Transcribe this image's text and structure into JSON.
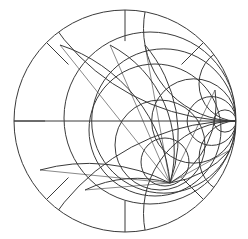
{
  "diagram": {
    "type": "smith-chart-overlay",
    "stroke": "#3a3a3a",
    "outer": {
      "cx": 125,
      "cy": 121,
      "r": 111
    },
    "point_a": {
      "x": 236,
      "y": 121
    },
    "point_b": {
      "x": 170,
      "y": 183
    },
    "resistance_circles_a": [
      0.35,
      0.62,
      0.78,
      0.9
    ],
    "reactance_a": [
      0.5,
      1.2,
      3.0
    ],
    "inner_circles_b": [
      {
        "cx": 150,
        "cy": 118,
        "r": 86
      },
      {
        "cx": 155,
        "cy": 130,
        "r": 66
      },
      {
        "cx": 160,
        "cy": 145,
        "r": 45
      },
      {
        "cx": 165,
        "cy": 162,
        "r": 24
      }
    ],
    "radial_angles_deg": [
      45,
      90,
      135,
      180,
      225,
      270,
      315
    ],
    "arcs_b": [
      {
        "x1": 60,
        "y1": 45,
        "rx": 160
      },
      {
        "x1": 110,
        "y1": 45,
        "rx": 120
      },
      {
        "x1": 145,
        "y1": 45,
        "rx": 140
      },
      {
        "x1": 40,
        "y1": 170,
        "rx": 180
      },
      {
        "x1": 85,
        "y1": 190,
        "rx": 120
      },
      {
        "x1": 215,
        "y1": 90,
        "rx": 90
      },
      {
        "x1": 230,
        "y1": 150,
        "rx": 100
      }
    ]
  }
}
